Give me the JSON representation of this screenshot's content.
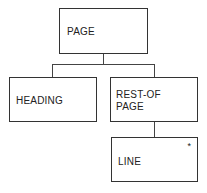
{
  "diagram": {
    "type": "tree",
    "nodes": [
      {
        "id": "page",
        "label": "PAGE"
      },
      {
        "id": "heading",
        "label": "HEADING"
      },
      {
        "id": "rest_of_page",
        "label": "REST-OF\nPAGE"
      },
      {
        "id": "line",
        "label": "LINE",
        "marker": "*"
      }
    ],
    "edges": [
      {
        "from": "page",
        "to": "heading"
      },
      {
        "from": "page",
        "to": "rest_of_page"
      },
      {
        "from": "rest_of_page",
        "to": "line"
      }
    ]
  },
  "nodes": {
    "page": "PAGE",
    "heading": "HEADING",
    "rest_of_page": "REST-OF\nPAGE",
    "line": "LINE",
    "line_marker": "*"
  }
}
